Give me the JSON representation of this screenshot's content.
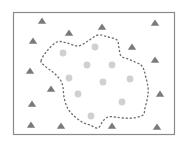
{
  "diagram": {
    "width": 185,
    "height": 143,
    "frame": {
      "x": 13.5,
      "y": 12.5,
      "w": 161,
      "h": 122,
      "stroke": "#8a8a8a"
    },
    "colors": {
      "triangle": "#7a7a7a",
      "circle": "#d0d0d0",
      "boundary": "#6e6e6e"
    },
    "boundary_points": [
      [
        41,
        61
      ],
      [
        47,
        51
      ],
      [
        57,
        42
      ],
      [
        67,
        43
      ],
      [
        78,
        46
      ],
      [
        88,
        41
      ],
      [
        98,
        35
      ],
      [
        108,
        37
      ],
      [
        117,
        40
      ],
      [
        119,
        48
      ],
      [
        121,
        56
      ],
      [
        128,
        59
      ],
      [
        135,
        62
      ],
      [
        141,
        65
      ],
      [
        144,
        70
      ],
      [
        146,
        78
      ],
      [
        148,
        87
      ],
      [
        148,
        94
      ],
      [
        147,
        100
      ],
      [
        145,
        108
      ],
      [
        143,
        115
      ],
      [
        133,
        118
      ],
      [
        123,
        118
      ],
      [
        115,
        117
      ],
      [
        108,
        117
      ],
      [
        103,
        121
      ],
      [
        98,
        128
      ],
      [
        90,
        125
      ],
      [
        82,
        122
      ],
      [
        73,
        115
      ],
      [
        67,
        107
      ],
      [
        64,
        97
      ],
      [
        63,
        87
      ],
      [
        61,
        81
      ],
      [
        58,
        77
      ],
      [
        54,
        73
      ],
      [
        50,
        70
      ],
      [
        45,
        66
      ]
    ],
    "triangles": [
      [
        42,
        21
      ],
      [
        69,
        33
      ],
      [
        102,
        27
      ],
      [
        155,
        23
      ],
      [
        33,
        41
      ],
      [
        132,
        47
      ],
      [
        155,
        60
      ],
      [
        30,
        71
      ],
      [
        51,
        89
      ],
      [
        160,
        94
      ],
      [
        32,
        104
      ],
      [
        31,
        125
      ],
      [
        61,
        126
      ],
      [
        112,
        126
      ],
      [
        157,
        127
      ]
    ],
    "circles": [
      [
        63,
        53
      ],
      [
        95,
        47
      ],
      [
        87,
        65
      ],
      [
        112,
        65
      ],
      [
        69,
        78
      ],
      [
        103,
        82
      ],
      [
        130,
        79
      ],
      [
        78,
        94
      ],
      [
        122,
        102
      ],
      [
        91,
        116
      ]
    ],
    "legend": {
      "triangle_icon": "triangle-marker",
      "circle_icon": "circle-marker"
    }
  }
}
